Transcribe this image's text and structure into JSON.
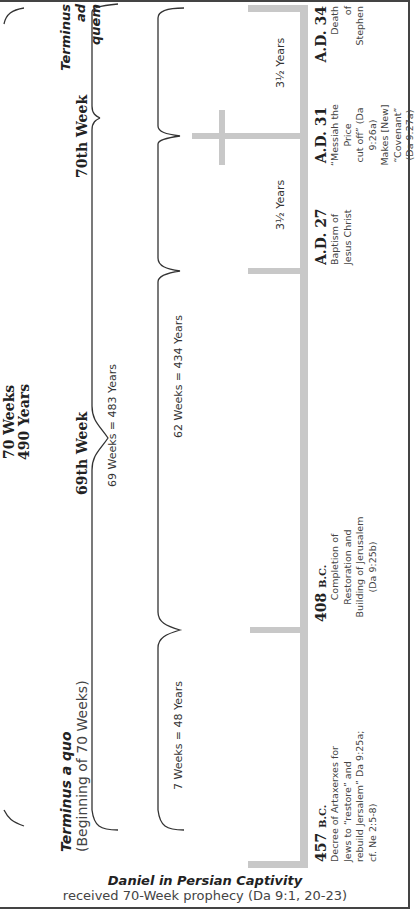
{
  "title": {
    "line1": "70 Weeks",
    "line2": "490 Years"
  },
  "terminus_a_quo": {
    "title": "Terminus a quo",
    "subtitle": "(Beginning of 70 Weeks)"
  },
  "terminus_ad_quem": {
    "line1": "Terminus ad",
    "line2": "quem"
  },
  "weeks_headers": {
    "week69": "69th Week",
    "week70": "70th Week"
  },
  "spans": {
    "s69": "69 Weeks = 483 Years",
    "s7": "7 Weeks = 48 Years",
    "s62": "62 Weeks = 434 Years",
    "half1": "3½ Years",
    "half2": "3½ Years"
  },
  "events": [
    {
      "date": "457",
      "era": "B.C.",
      "lines": [
        "Decree of Artaxerxes for",
        "Jews to “restore” and",
        "rebuild Jersalem” Da 9:25a;",
        "cf. Ne 2:5-8)"
      ]
    },
    {
      "date": "408",
      "era": "B.C.",
      "lines": [
        "Completion of",
        "Restoration and",
        "Building of Jerusalem",
        "(Da 9:25b)"
      ]
    },
    {
      "date": "A.D. 27",
      "era": "",
      "lines": [
        "Baptism of",
        "Jesus Christ"
      ]
    },
    {
      "date": "A.D. 31",
      "era": "",
      "lines": [
        "“Messiah the Price",
        "cut off” (Da 9:26a)",
        "Makes [New]",
        "“Covenant”",
        "(Da 9:27a)"
      ]
    },
    {
      "date": "A.D. 34",
      "era": "",
      "lines": [
        "Death",
        "of",
        "Stephen"
      ]
    }
  ],
  "footer": {
    "title": "Daniel in Persian Captivity",
    "subtitle": "received 70-Week prophecy (Da 9:1, 20-23)"
  },
  "colors": {
    "timeline": "#c8c8c8",
    "brace": "#333333",
    "border": "#444444"
  }
}
